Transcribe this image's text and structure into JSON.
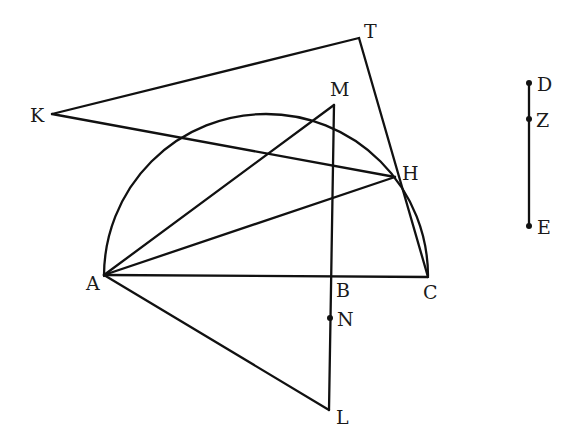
{
  "diagram": {
    "type": "geometric-construction",
    "stroke_color": "#111111",
    "background": "#ffffff",
    "semicircle": {
      "diameter_from": "A",
      "diameter_to": "C",
      "center": [
        266,
        276
      ],
      "radius": 162
    },
    "points": {
      "A": {
        "label": "A",
        "x": 104,
        "y": 275
      },
      "B": {
        "label": "B",
        "x": 332,
        "y": 276
      },
      "C": {
        "label": "C",
        "x": 428,
        "y": 277
      },
      "H": {
        "label": "H",
        "x": 395,
        "y": 177
      },
      "K": {
        "label": "K",
        "x": 52,
        "y": 114
      },
      "T": {
        "label": "T",
        "x": 359,
        "y": 38
      },
      "M": {
        "label": "M",
        "x": 334,
        "y": 105
      },
      "N": {
        "label": "N",
        "x": 330,
        "y": 318
      },
      "L": {
        "label": "L",
        "x": 329,
        "y": 410
      },
      "D": {
        "label": "D",
        "x": 529,
        "y": 83
      },
      "Z": {
        "label": "Z",
        "x": 529,
        "y": 119
      },
      "E": {
        "label": "E",
        "x": 529,
        "y": 226
      }
    },
    "segments": [
      [
        "K",
        "T"
      ],
      [
        "T",
        "C"
      ],
      [
        "K",
        "H"
      ],
      [
        "A",
        "M"
      ],
      [
        "A",
        "H"
      ],
      [
        "A",
        "C"
      ],
      [
        "M",
        "L"
      ],
      [
        "A",
        "L"
      ],
      [
        "H",
        "C"
      ],
      [
        "D",
        "E"
      ]
    ],
    "marked_points": [
      "N",
      "D",
      "Z",
      "E"
    ]
  }
}
